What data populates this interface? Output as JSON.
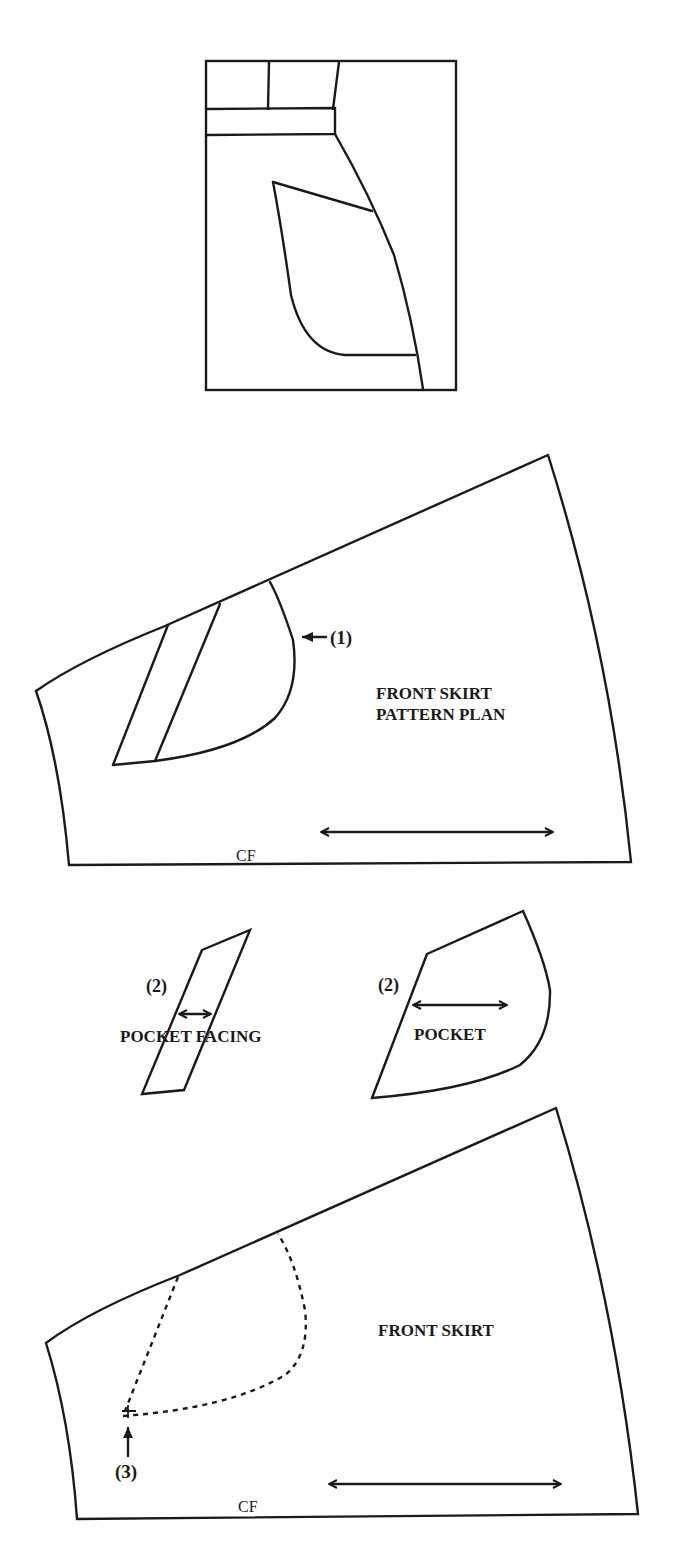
{
  "figure": {
    "type": "sewing pattern diagram",
    "panels": [
      {
        "id": "sketch",
        "label": ""
      },
      {
        "id": "pattern-plan",
        "label_line1": "FRONT SKIRT",
        "label_line2": "PATTERN PLAN",
        "cf_label": "CF",
        "callout": "(1)"
      },
      {
        "id": "pocket-facing",
        "label": "POCKET FACING",
        "callout": "(2)"
      },
      {
        "id": "pocket",
        "label": "POCKET",
        "callout": "(2)"
      },
      {
        "id": "front-skirt",
        "label": "FRONT SKIRT",
        "cf_label": "CF",
        "callout": "(3)"
      }
    ]
  },
  "labels": {
    "plan_title_1": "FRONT SKIRT",
    "plan_title_2": "PATTERN PLAN",
    "plan_cf": "CF",
    "callout_1": "(1)",
    "facing_title": "POCKET FACING",
    "facing_callout": "(2)",
    "pocket_title": "POCKET",
    "pocket_callout": "(2)",
    "skirt_title": "FRONT SKIRT",
    "skirt_cf": "CF",
    "callout_3": "(3)"
  },
  "colors": {
    "ink": "#1a1a1a",
    "paper": "#ffffff"
  }
}
